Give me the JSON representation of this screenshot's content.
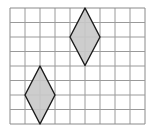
{
  "diagram": {
    "type": "grid-with-rhombi",
    "grid": {
      "columns": 9,
      "rows": 8,
      "origin_x": 10,
      "origin_y": 8,
      "cell_width": 15,
      "cell_height": 14.5,
      "line_color": "#9a9a9a",
      "border_color": "#8a8a8a"
    },
    "shapes": [
      {
        "name": "rhombus-upper",
        "fill": "#c8c8c8",
        "stroke": "#1a1a1a",
        "points": "85,8 100,37 85,65.5 70,37"
      },
      {
        "name": "rhombus-lower",
        "fill": "#c8c8c8",
        "stroke": "#1a1a1a",
        "points": "40,66 55,95 40,124 25,95"
      }
    ]
  }
}
